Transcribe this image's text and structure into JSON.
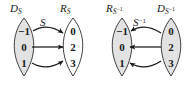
{
  "figure": {
    "type": "arrow-diagram-pair",
    "background": "#ffffff",
    "ink": "#1a1a1a",
    "shaded_fill": "#e2e2e2",
    "unshaded_fill": "#ffffff"
  },
  "diagrams": [
    {
      "id": "left",
      "relation_label": "S",
      "relation_label_sup": "",
      "left_set": {
        "name": "D",
        "subscript": "S",
        "subscript_sup": "",
        "shaded": true,
        "elements": [
          "−1",
          "0",
          "1"
        ]
      },
      "right_set": {
        "name": "R",
        "subscript": "S",
        "subscript_sup": "",
        "shaded": false,
        "elements": [
          "0",
          "2",
          "3"
        ]
      },
      "arrow_direction": "left-to-right",
      "mappings": [
        {
          "from": "−1",
          "to": "0",
          "shape": "curve-down"
        },
        {
          "from": "0",
          "to": "2",
          "shape": "straight"
        },
        {
          "from": "1",
          "to": "3",
          "shape": "curve-up"
        }
      ]
    },
    {
      "id": "right",
      "relation_label": "S",
      "relation_label_sup": "−1",
      "left_set": {
        "name": "R",
        "subscript": "S",
        "subscript_sup": "−1",
        "shaded": true,
        "elements": [
          "−1",
          "0",
          "1"
        ]
      },
      "right_set": {
        "name": "D",
        "subscript": "S",
        "subscript_sup": "−1",
        "shaded": true,
        "elements": [
          "0",
          "2",
          "3"
        ]
      },
      "arrow_direction": "right-to-left",
      "mappings": [
        {
          "from": "0",
          "to": "−1",
          "shape": "curve-down"
        },
        {
          "from": "2",
          "to": "0",
          "shape": "straight"
        },
        {
          "from": "3",
          "to": "1",
          "shape": "curve-up"
        }
      ]
    }
  ]
}
